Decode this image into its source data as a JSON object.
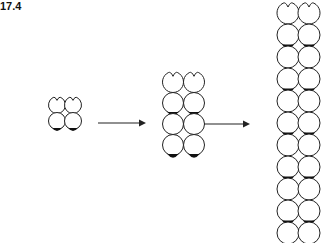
{
  "figure": {
    "label": "17.4",
    "stroke_color": "#222222",
    "fill_color": "#ffffff",
    "cap_color": "#111111"
  },
  "stages": [
    {
      "name": "stage-1",
      "columns": [
        57,
        73
      ],
      "rows": [
        105,
        121
      ],
      "radius": 8.5,
      "caps_after_rows": [
        1
      ]
    },
    {
      "name": "stage-2",
      "columns": [
        173,
        194
      ],
      "rows": [
        82,
        103,
        124,
        145
      ],
      "radius": 10.5,
      "caps_after_rows": [
        1,
        3
      ]
    },
    {
      "name": "stage-3",
      "columns": [
        288,
        309
      ],
      "rows": [
        13,
        35,
        57,
        79,
        101,
        123,
        145,
        167,
        189,
        211,
        233
      ],
      "radius": 11,
      "caps_after_rows": [
        1,
        3,
        5,
        7,
        9
      ]
    }
  ],
  "arrows": [
    {
      "name": "arrow-1",
      "x1": 98,
      "x2": 146,
      "y": 123
    },
    {
      "name": "arrow-2",
      "x1": 204,
      "x2": 250,
      "y": 124
    }
  ]
}
